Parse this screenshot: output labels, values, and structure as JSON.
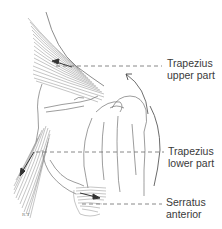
{
  "figure": {
    "colors": {
      "line": "#5a5a5a",
      "fiber": "#8a8a8a",
      "leader": "#6a6a6a",
      "label": "#3a3a3a",
      "background": "#ffffff"
    },
    "labels": [
      {
        "id": "trapezius-upper",
        "line1": "Trapezius",
        "line2": "upper part"
      },
      {
        "id": "trapezius-lower",
        "line1": "Trapezius",
        "line2": "lower part"
      },
      {
        "id": "serratus-anterior",
        "line1": "Serratus",
        "line2": "anterior"
      }
    ]
  }
}
